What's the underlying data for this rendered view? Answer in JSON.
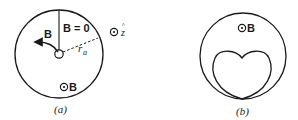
{
  "figure": {
    "panel_a": {
      "caption": "(a)",
      "field_zero_label": "B = 0",
      "field_arrow_label": "B",
      "field_out_label": "B",
      "radius_label": "r",
      "radius_subscript": "a",
      "axis_label": "z",
      "axis_hat": "^",
      "out_of_page_symbol": "dot-in-circle"
    },
    "panel_b": {
      "caption": "(b)",
      "field_out_label": "B",
      "out_of_page_symbol": "dot-in-circle"
    }
  },
  "colors": {
    "ink": "#1a1a1a",
    "background": "#ffffff"
  }
}
